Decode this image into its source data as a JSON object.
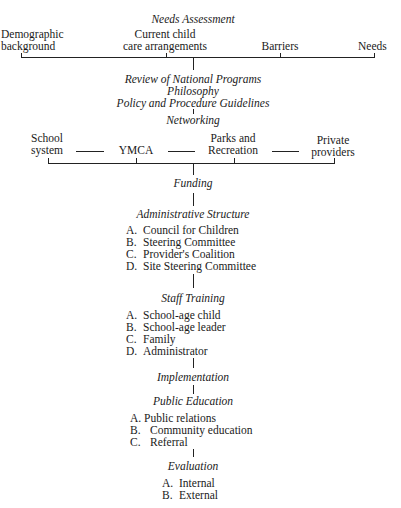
{
  "diagram": {
    "needs_assessment": {
      "title": "Needs Assessment",
      "items": [
        {
          "line1": "Demographic",
          "line2": "background"
        },
        {
          "line1": "Current child",
          "line2": "care arrangements"
        },
        {
          "line1": "",
          "line2": "Barriers"
        },
        {
          "line1": "",
          "line2": "Needs"
        }
      ]
    },
    "review": {
      "line1": "Review of National Programs",
      "line2": "Philosophy",
      "line3": "Policy and Procedure Guidelines"
    },
    "networking": {
      "title": "Networking",
      "items": [
        {
          "line1": "School",
          "line2": "system"
        },
        {
          "line1": "",
          "line2": "YMCA"
        },
        {
          "line1": "Parks and",
          "line2": "Recreation"
        },
        {
          "line1": "Private",
          "line2": "providers"
        }
      ],
      "dash": "———"
    },
    "funding": {
      "title": "Funding"
    },
    "administrative_structure": {
      "title": "Administrative Structure",
      "items": [
        {
          "letter": "A.",
          "label": "Council for Children"
        },
        {
          "letter": "B.",
          "label": "Steering Committee"
        },
        {
          "letter": "C.",
          "label": "Provider's Coalition"
        },
        {
          "letter": "D.",
          "label": "Site Steering Committee"
        }
      ]
    },
    "staff_training": {
      "title": "Staff Training",
      "items": [
        {
          "letter": "A.",
          "label": "School-age child"
        },
        {
          "letter": "B.",
          "label": "School-age leader"
        },
        {
          "letter": "C.",
          "label": "Family"
        },
        {
          "letter": "D.",
          "label": "Administrator"
        }
      ]
    },
    "implementation": {
      "title": "Implementation"
    },
    "public_education": {
      "title": "Public Education",
      "items": [
        {
          "letter": "A.",
          "label": "Public relations"
        },
        {
          "letter": "B.",
          "label": "Community education"
        },
        {
          "letter": "C.",
          "label": "Referral"
        }
      ]
    },
    "evaluation": {
      "title": "Evaluation",
      "items": [
        {
          "letter": "A.",
          "label": "Internal"
        },
        {
          "letter": "B.",
          "label": "External"
        }
      ]
    }
  }
}
